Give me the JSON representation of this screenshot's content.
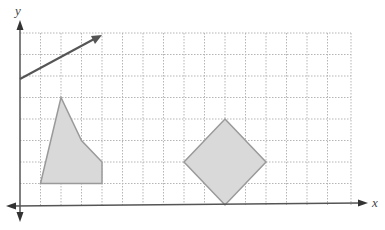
{
  "diagram": {
    "type": "coordinate-grid",
    "axes": {
      "x_label": "x",
      "y_label": "y"
    },
    "grid": {
      "columns": 16,
      "rows": 8,
      "line_style": "dotted",
      "line_color": "#b5b5b5"
    },
    "colors": {
      "axis": "#555555",
      "shape_fill": "#d9d9d9",
      "shape_stroke": "#9a9a9a",
      "vector": "#555555"
    },
    "shapes": [
      {
        "name": "quadrilateral",
        "vertices_grid": [
          [
            1,
            1
          ],
          [
            2,
            5
          ],
          [
            3,
            3
          ],
          [
            4,
            2
          ],
          [
            4,
            1
          ]
        ]
      },
      {
        "name": "diamond",
        "vertices_grid": [
          [
            10,
            4
          ],
          [
            12,
            2
          ],
          [
            10,
            0
          ],
          [
            8,
            2
          ]
        ]
      }
    ],
    "vectors": [
      {
        "name": "arrow-vector",
        "from_grid": [
          0,
          6
        ],
        "to_grid": [
          4,
          8
        ]
      }
    ]
  }
}
